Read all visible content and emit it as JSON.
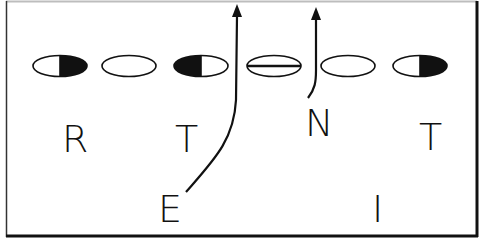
{
  "diagram": {
    "type": "football-defensive-formation",
    "frame": {
      "stroke": "#1a1a1a"
    },
    "offensive_line": [
      {
        "id": "o1",
        "cx": 60,
        "fill": "right-black"
      },
      {
        "id": "o2",
        "cx": 129,
        "fill": "none"
      },
      {
        "id": "o3",
        "cx": 201,
        "fill": "left-black"
      },
      {
        "id": "o4",
        "cx": 274,
        "fill": "center-line"
      },
      {
        "id": "o5",
        "cx": 348,
        "fill": "none"
      },
      {
        "id": "o6",
        "cx": 420,
        "fill": "right-black"
      }
    ],
    "labels": [
      {
        "id": "R",
        "text": "R",
        "x": 62,
        "y": 152
      },
      {
        "id": "T1",
        "text": "T",
        "x": 176,
        "y": 152
      },
      {
        "id": "N",
        "text": "N",
        "x": 306,
        "y": 136
      },
      {
        "id": "T2",
        "text": "T",
        "x": 420,
        "y": 150
      },
      {
        "id": "E",
        "text": "E",
        "x": 158,
        "y": 222
      },
      {
        "id": "I",
        "text": "I",
        "x": 372,
        "y": 222
      }
    ],
    "arrows": [
      {
        "id": "e-rush",
        "from": "E",
        "path": "M186,192 C214,160 234,140 236,100 L237,14"
      },
      {
        "id": "n-rush",
        "from": "N",
        "path": "M308,98 C316,88 316,80 316,70 L316,17"
      }
    ]
  }
}
